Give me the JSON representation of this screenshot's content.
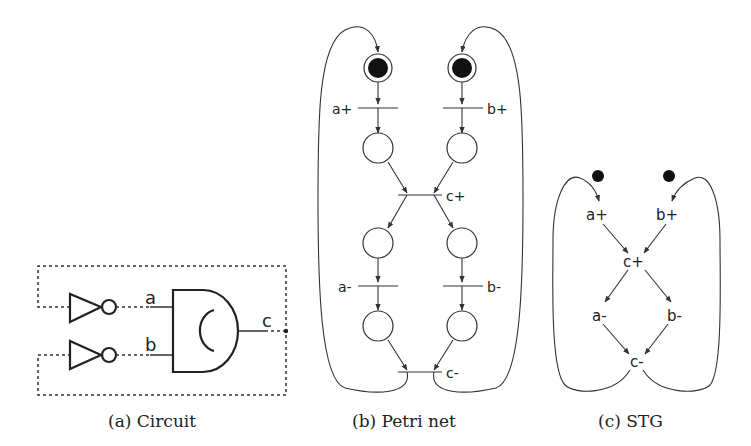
{
  "figure": {
    "panels": [
      {
        "id": "circuit",
        "caption": "(a) Circuit",
        "labels": {
          "input_a": "a",
          "input_b": "b",
          "output_c": "c"
        },
        "components": [
          "inverter",
          "inverter",
          "c-element (AND-style gate with C)"
        ]
      },
      {
        "id": "petri",
        "caption": "(b) Petri net",
        "transitions": [
          "a+",
          "b+",
          "c+",
          "a-",
          "b-",
          "c-"
        ],
        "marked_places": 2,
        "unmarked_places": 6
      },
      {
        "id": "stg",
        "caption": "(c) STG",
        "nodes": [
          "a+",
          "b+",
          "c+",
          "a-",
          "b-",
          "c-"
        ],
        "tokens": 2,
        "edges": [
          [
            "a+",
            "c+"
          ],
          [
            "b+",
            "c+"
          ],
          [
            "c+",
            "a-"
          ],
          [
            "c+",
            "b-"
          ],
          [
            "a-",
            "c-"
          ],
          [
            "b-",
            "c-"
          ],
          [
            "c-",
            "a+"
          ],
          [
            "c-",
            "b+"
          ]
        ]
      }
    ],
    "colors": {
      "stroke": "#333333",
      "token": "#111111",
      "background": "#ffffff"
    }
  }
}
